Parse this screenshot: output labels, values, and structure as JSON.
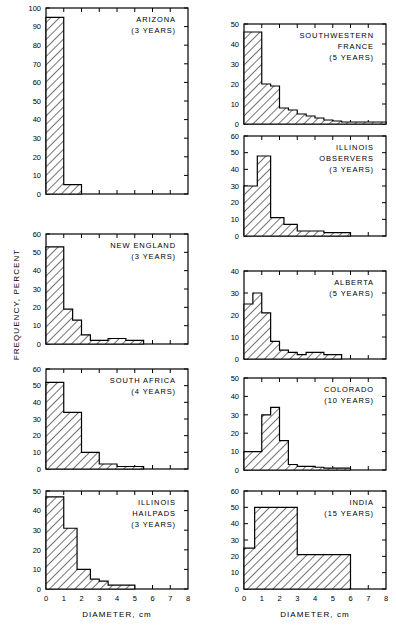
{
  "figure": {
    "xlabel": "DIAMETER, cm",
    "ylabel": "FREQUENCY, PERCENT",
    "x_ticks": [
      0,
      1,
      2,
      3,
      4,
      5,
      6,
      7,
      8
    ],
    "xlim": [
      0,
      8
    ],
    "ink": "#000000",
    "background": "#ffffff"
  },
  "chart_data": [
    {
      "type": "bar",
      "id": "arizona",
      "title": [
        "ARIZONA",
        "(3 YEARS)"
      ],
      "region": "ARIZONA",
      "years_label": "(3 YEARS)",
      "years": 3,
      "xlabel": "DIAMETER, cm",
      "ylabel": "FREQUENCY, PERCENT",
      "xlim": [
        0,
        8
      ],
      "ylim": [
        0,
        100
      ],
      "y_ticks": [
        0,
        10,
        20,
        30,
        40,
        50,
        60,
        70,
        80,
        90,
        100
      ],
      "y_tick_step": 10,
      "grid": false,
      "bin_edges": [
        0,
        1,
        2
      ],
      "values": [
        95,
        5
      ],
      "column": "left",
      "row": 1
    },
    {
      "type": "bar",
      "id": "new-england",
      "title": [
        "NEW ENGLAND",
        "(3 YEARS)"
      ],
      "region": "NEW ENGLAND",
      "years_label": "(3 YEARS)",
      "years": 3,
      "xlabel": "DIAMETER, cm",
      "ylabel": "FREQUENCY, PERCENT",
      "xlim": [
        0,
        8
      ],
      "ylim": [
        0,
        60
      ],
      "y_ticks": [
        0,
        10,
        20,
        30,
        40,
        50,
        60
      ],
      "y_tick_step": 10,
      "grid": false,
      "bin_edges": [
        0,
        0.5,
        1.0,
        1.5,
        2.0,
        2.5,
        3.0,
        3.5,
        4.0,
        4.5,
        5.0,
        5.5
      ],
      "values": [
        53,
        53,
        19,
        13,
        5,
        2,
        2,
        3,
        3,
        2,
        2
      ],
      "column": "left",
      "row": 2
    },
    {
      "type": "bar",
      "id": "south-africa",
      "title": [
        "SOUTH AFRICA",
        "(4 YEARS)"
      ],
      "region": "SOUTH AFRICA",
      "years_label": "(4 YEARS)",
      "years": 4,
      "xlabel": "DIAMETER, cm",
      "ylabel": "FREQUENCY, PERCENT",
      "xlim": [
        0,
        8
      ],
      "ylim": [
        0,
        60
      ],
      "y_ticks": [
        0,
        10,
        20,
        30,
        40,
        50,
        60
      ],
      "y_tick_step": 10,
      "grid": false,
      "bin_edges": [
        0,
        1,
        2,
        3,
        3.5,
        4,
        4.5,
        5,
        5.5
      ],
      "values": [
        52,
        34,
        10,
        3,
        3,
        1.5,
        1.5,
        1.5
      ],
      "column": "left",
      "row": 3
    },
    {
      "type": "bar",
      "id": "illinois-hailpads",
      "title": [
        "ILLINOIS",
        "HAILPADS",
        "(3 YEARS)"
      ],
      "region": "ILLINOIS HAILPADS",
      "years_label": "(3 YEARS)",
      "years": 3,
      "xlabel": "DIAMETER, cm",
      "ylabel": "FREQUENCY, PERCENT",
      "xlim": [
        0,
        8
      ],
      "ylim": [
        0,
        50
      ],
      "y_ticks": [
        0,
        10,
        20,
        30,
        40,
        50
      ],
      "y_tick_step": 10,
      "grid": false,
      "bin_edges": [
        0,
        1,
        1.75,
        2.5,
        3.0,
        3.5,
        4.0,
        5.0
      ],
      "values": [
        47,
        31,
        10,
        5,
        4,
        2,
        2
      ],
      "column": "left",
      "row": 4,
      "show_x_labels": true
    },
    {
      "type": "bar",
      "id": "southwestern-france",
      "title": [
        "SOUTHWESTERN",
        "FRANCE",
        "(5 YEARS)"
      ],
      "region": "SOUTHWESTERN FRANCE",
      "years_label": "(5 YEARS)",
      "years": 5,
      "xlabel": "DIAMETER, cm",
      "ylabel": "FREQUENCY, PERCENT",
      "xlim": [
        0,
        8
      ],
      "ylim": [
        0,
        50
      ],
      "y_ticks": [
        0,
        10,
        20,
        30,
        40,
        50
      ],
      "y_tick_step": 10,
      "grid": false,
      "bin_edges": [
        0,
        0.5,
        1.0,
        1.5,
        2.0,
        2.5,
        3.0,
        3.5,
        4.0,
        4.5,
        5.0,
        5.5,
        6.0,
        8.0
      ],
      "values": [
        46,
        46,
        20,
        19,
        8,
        7,
        5,
        4,
        3,
        2,
        1.5,
        1,
        1
      ],
      "column": "right",
      "row": 1
    },
    {
      "type": "bar",
      "id": "illinois-observers",
      "title": [
        "ILLINOIS",
        "OBSERVERS",
        "(3 YEARS)"
      ],
      "region": "ILLINOIS OBSERVERS",
      "years_label": "(3 YEARS)",
      "years": 3,
      "xlabel": "DIAMETER, cm",
      "ylabel": "FREQUENCY, PERCENT",
      "xlim": [
        0,
        8
      ],
      "ylim": [
        0,
        60
      ],
      "y_ticks": [
        0,
        10,
        20,
        30,
        40,
        50,
        60
      ],
      "y_tick_step": 10,
      "grid": false,
      "bin_edges": [
        0,
        0.75,
        1.5,
        2.25,
        3.0,
        3.75,
        4.5,
        5.25,
        6.0
      ],
      "values": [
        30,
        48,
        11,
        7,
        3,
        3,
        2,
        2
      ],
      "column": "right",
      "row": 2
    },
    {
      "type": "bar",
      "id": "alberta",
      "title": [
        "ALBERTA",
        "(5 YEARS)"
      ],
      "region": "ALBERTA",
      "years_label": "(5 YEARS)",
      "years": 5,
      "xlabel": "DIAMETER, cm",
      "ylabel": "FREQUENCY, PERCENT",
      "xlim": [
        0,
        8
      ],
      "ylim": [
        0,
        40
      ],
      "y_ticks": [
        0,
        10,
        20,
        30,
        40
      ],
      "y_tick_step": 10,
      "grid": false,
      "bin_edges": [
        0,
        0.5,
        1.0,
        1.5,
        2.0,
        2.5,
        3.0,
        3.5,
        4.0,
        4.5,
        5.0,
        5.5
      ],
      "values": [
        25,
        30,
        21,
        8,
        4,
        3,
        2,
        3,
        3,
        2,
        2
      ],
      "column": "right",
      "row": 3
    },
    {
      "type": "bar",
      "id": "colorado",
      "title": [
        "COLORADO",
        "(10 YEARS)"
      ],
      "region": "COLORADO",
      "years_label": "(10 YEARS)",
      "years": 10,
      "xlabel": "DIAMETER, cm",
      "ylabel": "FREQUENCY, PERCENT",
      "xlim": [
        0,
        8
      ],
      "ylim": [
        0,
        50
      ],
      "y_ticks": [
        0,
        10,
        20,
        30,
        40,
        50
      ],
      "y_tick_step": 10,
      "grid": false,
      "bin_edges": [
        0,
        0.5,
        1.0,
        1.5,
        2.0,
        2.5,
        3.0,
        3.5,
        4.0,
        4.5,
        5.0,
        5.5,
        6.0
      ],
      "values": [
        10,
        10,
        30,
        34,
        16,
        3,
        2,
        2,
        1.5,
        1,
        1,
        1
      ],
      "column": "right",
      "row": 4
    },
    {
      "type": "bar",
      "id": "india",
      "title": [
        "INDIA",
        "(15 YEARS)"
      ],
      "region": "INDIA",
      "years_label": "(15 YEARS)",
      "years": 15,
      "xlabel": "DIAMETER, cm",
      "ylabel": "FREQUENCY, PERCENT",
      "xlim": [
        0,
        8
      ],
      "ylim": [
        0,
        60
      ],
      "y_ticks": [
        0,
        10,
        20,
        30,
        40,
        50,
        60
      ],
      "y_tick_step": 10,
      "grid": false,
      "bin_edges": [
        0,
        0.6,
        3.0,
        6.0
      ],
      "values": [
        25,
        50,
        21
      ],
      "column": "right",
      "row": 5,
      "show_x_labels": true
    }
  ]
}
